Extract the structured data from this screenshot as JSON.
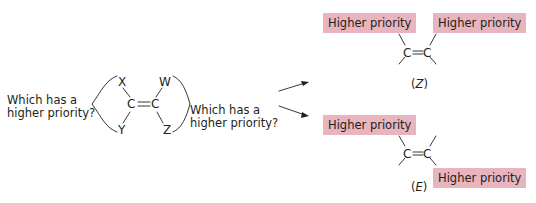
{
  "diagram": {
    "left_question": {
      "line1": "Which has a",
      "line2": "higher priority?"
    },
    "right_question": {
      "line1": "Which has a",
      "line2": "higher priority?"
    },
    "molecule": {
      "atoms": {
        "top_left": "X",
        "bottom_left": "Y",
        "top_right": "W",
        "bottom_right": "Z",
        "carbon": "C",
        "double_bond": "="
      }
    },
    "outcomes": [
      {
        "label_open": "(",
        "label": "Z",
        "label_close": ")",
        "tags": [
          "Higher priority",
          "Higher priority"
        ],
        "carbon": "C"
      },
      {
        "label_open": "(",
        "label": "E",
        "label_close": ")",
        "tags": [
          "Higher priority",
          "Higher priority"
        ],
        "carbon": "C"
      }
    ],
    "colors": {
      "highlight": "#e8b4bd",
      "ink": "#231f20"
    }
  }
}
